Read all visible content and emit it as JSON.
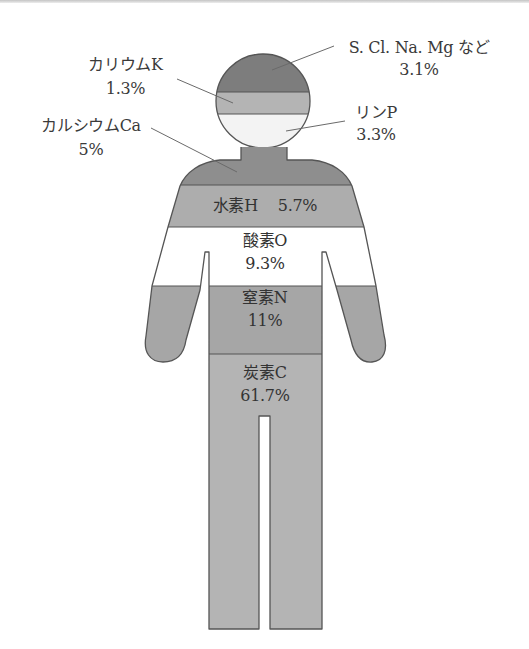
{
  "diagram": {
    "type": "human-body-element-composition",
    "colors": {
      "head_top_other": "#7d7d7d",
      "potassium": "#b4b4b4",
      "phosphorus": "#f3f3f3",
      "calcium": "#8e8e8e",
      "hydrogen": "#adadad",
      "oxygen": "#ffffff",
      "nitrogen": "#a6a6a6",
      "carbon": "#b4b4b4",
      "outline": "#555555",
      "leader_line": "#6a6a6a",
      "text": "#3a3a3a"
    },
    "elements": [
      {
        "key": "other",
        "name": "S. Cl. Na. Mg など",
        "value": "3.1%"
      },
      {
        "key": "potassium",
        "name": "カリウムK",
        "value": "1.3%"
      },
      {
        "key": "phosphorus",
        "name": "リンP",
        "value": "3.3%"
      },
      {
        "key": "calcium",
        "name": "カルシウムCa",
        "value": "5%"
      },
      {
        "key": "hydrogen",
        "name": "水素H",
        "value": "5.7%"
      },
      {
        "key": "oxygen",
        "name": "酸素O",
        "value": "9.3%"
      },
      {
        "key": "nitrogen",
        "name": "窒素N",
        "value": "11%"
      },
      {
        "key": "carbon",
        "name": "炭素C",
        "value": "61.7%"
      }
    ]
  }
}
